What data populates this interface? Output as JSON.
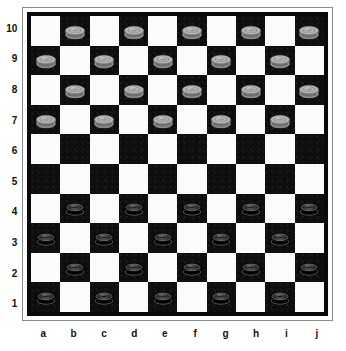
{
  "board": {
    "type": "international-draughts",
    "size": 10,
    "files": [
      "a",
      "b",
      "c",
      "d",
      "e",
      "f",
      "g",
      "h",
      "i",
      "j"
    ],
    "ranks": [
      "10",
      "9",
      "8",
      "7",
      "6",
      "5",
      "4",
      "3",
      "2",
      "1"
    ],
    "colors": {
      "light_square": "#fbfbfb",
      "dark_square": "#0d0d0d",
      "border": "#0a0a0a",
      "frame": "#8c8c8c",
      "background": "#ffffff",
      "white_piece": "#a8a8a8",
      "black_piece": "#101010",
      "label_text": "#111111"
    },
    "light_square_at_a10": true,
    "pieces_on_dark_squares": true,
    "counts": {
      "white": 20,
      "black": 20,
      "empty_rows": [
        "6",
        "5"
      ]
    },
    "rows": [
      {
        "rank": "10",
        "cells": [
          {
            "file": "a",
            "square": "light",
            "piece": null
          },
          {
            "file": "b",
            "square": "dark",
            "piece": "white"
          },
          {
            "file": "c",
            "square": "light",
            "piece": null
          },
          {
            "file": "d",
            "square": "dark",
            "piece": "white"
          },
          {
            "file": "e",
            "square": "light",
            "piece": null
          },
          {
            "file": "f",
            "square": "dark",
            "piece": "white"
          },
          {
            "file": "g",
            "square": "light",
            "piece": null
          },
          {
            "file": "h",
            "square": "dark",
            "piece": "white"
          },
          {
            "file": "i",
            "square": "light",
            "piece": null
          },
          {
            "file": "j",
            "square": "dark",
            "piece": "white"
          }
        ]
      },
      {
        "rank": "9",
        "cells": [
          {
            "file": "a",
            "square": "dark",
            "piece": "white"
          },
          {
            "file": "b",
            "square": "light",
            "piece": null
          },
          {
            "file": "c",
            "square": "dark",
            "piece": "white"
          },
          {
            "file": "d",
            "square": "light",
            "piece": null
          },
          {
            "file": "e",
            "square": "dark",
            "piece": "white"
          },
          {
            "file": "f",
            "square": "light",
            "piece": null
          },
          {
            "file": "g",
            "square": "dark",
            "piece": "white"
          },
          {
            "file": "h",
            "square": "light",
            "piece": null
          },
          {
            "file": "i",
            "square": "dark",
            "piece": "white"
          },
          {
            "file": "j",
            "square": "light",
            "piece": null
          }
        ]
      },
      {
        "rank": "8",
        "cells": [
          {
            "file": "a",
            "square": "light",
            "piece": null
          },
          {
            "file": "b",
            "square": "dark",
            "piece": "white"
          },
          {
            "file": "c",
            "square": "light",
            "piece": null
          },
          {
            "file": "d",
            "square": "dark",
            "piece": "white"
          },
          {
            "file": "e",
            "square": "light",
            "piece": null
          },
          {
            "file": "f",
            "square": "dark",
            "piece": "white"
          },
          {
            "file": "g",
            "square": "light",
            "piece": null
          },
          {
            "file": "h",
            "square": "dark",
            "piece": "white"
          },
          {
            "file": "i",
            "square": "light",
            "piece": null
          },
          {
            "file": "j",
            "square": "dark",
            "piece": "white"
          }
        ]
      },
      {
        "rank": "7",
        "cells": [
          {
            "file": "a",
            "square": "dark",
            "piece": "white"
          },
          {
            "file": "b",
            "square": "light",
            "piece": null
          },
          {
            "file": "c",
            "square": "dark",
            "piece": "white"
          },
          {
            "file": "d",
            "square": "light",
            "piece": null
          },
          {
            "file": "e",
            "square": "dark",
            "piece": "white"
          },
          {
            "file": "f",
            "square": "light",
            "piece": null
          },
          {
            "file": "g",
            "square": "dark",
            "piece": "white"
          },
          {
            "file": "h",
            "square": "light",
            "piece": null
          },
          {
            "file": "i",
            "square": "dark",
            "piece": "white"
          },
          {
            "file": "j",
            "square": "light",
            "piece": null
          }
        ]
      },
      {
        "rank": "6",
        "cells": [
          {
            "file": "a",
            "square": "light",
            "piece": null
          },
          {
            "file": "b",
            "square": "dark",
            "piece": null
          },
          {
            "file": "c",
            "square": "light",
            "piece": null
          },
          {
            "file": "d",
            "square": "dark",
            "piece": null
          },
          {
            "file": "e",
            "square": "light",
            "piece": null
          },
          {
            "file": "f",
            "square": "dark",
            "piece": null
          },
          {
            "file": "g",
            "square": "light",
            "piece": null
          },
          {
            "file": "h",
            "square": "dark",
            "piece": null
          },
          {
            "file": "i",
            "square": "light",
            "piece": null
          },
          {
            "file": "j",
            "square": "dark",
            "piece": null
          }
        ]
      },
      {
        "rank": "5",
        "cells": [
          {
            "file": "a",
            "square": "dark",
            "piece": null
          },
          {
            "file": "b",
            "square": "light",
            "piece": null
          },
          {
            "file": "c",
            "square": "dark",
            "piece": null
          },
          {
            "file": "d",
            "square": "light",
            "piece": null
          },
          {
            "file": "e",
            "square": "dark",
            "piece": null
          },
          {
            "file": "f",
            "square": "light",
            "piece": null
          },
          {
            "file": "g",
            "square": "dark",
            "piece": null
          },
          {
            "file": "h",
            "square": "light",
            "piece": null
          },
          {
            "file": "i",
            "square": "dark",
            "piece": null
          },
          {
            "file": "j",
            "square": "light",
            "piece": null
          }
        ]
      },
      {
        "rank": "4",
        "cells": [
          {
            "file": "a",
            "square": "light",
            "piece": null
          },
          {
            "file": "b",
            "square": "dark",
            "piece": "black"
          },
          {
            "file": "c",
            "square": "light",
            "piece": null
          },
          {
            "file": "d",
            "square": "dark",
            "piece": "black"
          },
          {
            "file": "e",
            "square": "light",
            "piece": null
          },
          {
            "file": "f",
            "square": "dark",
            "piece": "black"
          },
          {
            "file": "g",
            "square": "light",
            "piece": null
          },
          {
            "file": "h",
            "square": "dark",
            "piece": "black"
          },
          {
            "file": "i",
            "square": "light",
            "piece": null
          },
          {
            "file": "j",
            "square": "dark",
            "piece": "black"
          }
        ]
      },
      {
        "rank": "3",
        "cells": [
          {
            "file": "a",
            "square": "dark",
            "piece": "black"
          },
          {
            "file": "b",
            "square": "light",
            "piece": null
          },
          {
            "file": "c",
            "square": "dark",
            "piece": "black"
          },
          {
            "file": "d",
            "square": "light",
            "piece": null
          },
          {
            "file": "e",
            "square": "dark",
            "piece": "black"
          },
          {
            "file": "f",
            "square": "light",
            "piece": null
          },
          {
            "file": "g",
            "square": "dark",
            "piece": "black"
          },
          {
            "file": "h",
            "square": "light",
            "piece": null
          },
          {
            "file": "i",
            "square": "dark",
            "piece": "black"
          },
          {
            "file": "j",
            "square": "light",
            "piece": null
          }
        ]
      },
      {
        "rank": "2",
        "cells": [
          {
            "file": "a",
            "square": "light",
            "piece": null
          },
          {
            "file": "b",
            "square": "dark",
            "piece": "black"
          },
          {
            "file": "c",
            "square": "light",
            "piece": null
          },
          {
            "file": "d",
            "square": "dark",
            "piece": "black"
          },
          {
            "file": "e",
            "square": "light",
            "piece": null
          },
          {
            "file": "f",
            "square": "dark",
            "piece": "black"
          },
          {
            "file": "g",
            "square": "light",
            "piece": null
          },
          {
            "file": "h",
            "square": "dark",
            "piece": "black"
          },
          {
            "file": "i",
            "square": "light",
            "piece": null
          },
          {
            "file": "j",
            "square": "dark",
            "piece": "black"
          }
        ]
      },
      {
        "rank": "1",
        "cells": [
          {
            "file": "a",
            "square": "dark",
            "piece": "black"
          },
          {
            "file": "b",
            "square": "light",
            "piece": null
          },
          {
            "file": "c",
            "square": "dark",
            "piece": "black"
          },
          {
            "file": "d",
            "square": "light",
            "piece": null
          },
          {
            "file": "e",
            "square": "dark",
            "piece": "black"
          },
          {
            "file": "f",
            "square": "light",
            "piece": null
          },
          {
            "file": "g",
            "square": "dark",
            "piece": "black"
          },
          {
            "file": "h",
            "square": "light",
            "piece": null
          },
          {
            "file": "i",
            "square": "dark",
            "piece": "black"
          },
          {
            "file": "j",
            "square": "light",
            "piece": null
          }
        ]
      }
    ]
  }
}
